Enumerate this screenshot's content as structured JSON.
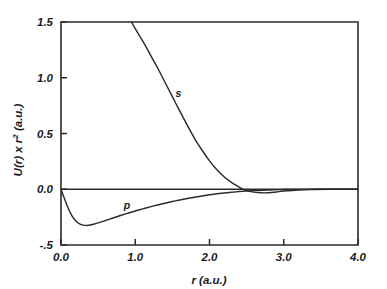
{
  "chart_data": {
    "type": "line",
    "title": "",
    "xlabel": "r (a.u.)",
    "ylabel": "U(r) x r2  (a.u.)",
    "ylabel_base": "U(r) x r",
    "ylabel_exponent": "2",
    "ylabel_units": "(a.u.)",
    "xlim": [
      0.0,
      4.0
    ],
    "ylim": [
      -0.5,
      1.5
    ],
    "grid": false,
    "legend": "none",
    "xticks": [
      0.0,
      1.0,
      2.0,
      3.0,
      4.0
    ],
    "xtick_labels": [
      "0.0",
      "1.0",
      "2.0",
      "3.0",
      "4.0"
    ],
    "yticks": [
      -0.5,
      0.0,
      0.5,
      1.0,
      1.5
    ],
    "ytick_labels": [
      "-.5",
      "0.0",
      "0.5",
      "1.0",
      "1.5"
    ],
    "zero_line": 0.0,
    "annotations": [
      {
        "text": "s",
        "x": 1.58,
        "y": 0.83
      },
      {
        "text": "p",
        "x": 0.89,
        "y": -0.18
      }
    ],
    "series": [
      {
        "name": "s",
        "label": "s",
        "color": "#2b2b2b",
        "x": [
          0.95,
          1.0,
          1.1,
          1.2,
          1.3,
          1.4,
          1.5,
          1.6,
          1.7,
          1.8,
          1.9,
          2.0,
          2.1,
          2.2,
          2.3,
          2.4,
          2.45,
          2.5,
          2.6,
          2.7,
          2.8,
          2.9,
          3.0,
          3.2,
          3.4,
          3.6,
          3.8,
          4.0
        ],
        "y": [
          1.5,
          1.44,
          1.33,
          1.21,
          1.09,
          0.96,
          0.83,
          0.7,
          0.575,
          0.455,
          0.35,
          0.255,
          0.175,
          0.11,
          0.06,
          0.02,
          0.0,
          -0.012,
          -0.026,
          -0.032,
          -0.031,
          -0.024,
          -0.016,
          -0.006,
          -0.002,
          0.0,
          0.0,
          0.0
        ]
      },
      {
        "name": "p",
        "label": "p",
        "color": "#2b2b2b",
        "x": [
          0.0,
          0.05,
          0.1,
          0.15,
          0.2,
          0.25,
          0.3,
          0.35,
          0.4,
          0.45,
          0.5,
          0.6,
          0.7,
          0.8,
          0.9,
          1.0,
          1.1,
          1.2,
          1.3,
          1.4,
          1.5,
          1.6,
          1.7,
          1.8,
          1.9,
          2.0,
          2.1,
          2.2,
          2.3,
          2.4,
          2.5,
          2.6,
          2.8,
          3.0,
          3.2,
          3.5,
          4.0
        ],
        "y": [
          0.0,
          -0.09,
          -0.175,
          -0.24,
          -0.285,
          -0.31,
          -0.322,
          -0.325,
          -0.32,
          -0.312,
          -0.302,
          -0.28,
          -0.258,
          -0.236,
          -0.215,
          -0.195,
          -0.176,
          -0.158,
          -0.141,
          -0.125,
          -0.11,
          -0.096,
          -0.083,
          -0.071,
          -0.06,
          -0.05,
          -0.041,
          -0.034,
          -0.027,
          -0.021,
          -0.016,
          -0.012,
          -0.006,
          -0.003,
          -0.001,
          0.0,
          0.0
        ]
      }
    ]
  }
}
